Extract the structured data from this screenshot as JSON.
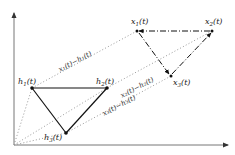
{
  "diagram": {
    "type": "formation-shape-diagram",
    "axes": {
      "origin": [
        14,
        145
      ],
      "y_end": [
        14,
        12
      ],
      "x_end": [
        229,
        145
      ],
      "color": "#555555"
    },
    "reference_shape": {
      "style": "solid",
      "color": "#111111",
      "nodes": [
        {
          "id": "h1",
          "label": "h",
          "sub": "1",
          "arg": "(t)",
          "x": 32,
          "y": 88,
          "label_x": 18,
          "label_y": 84
        },
        {
          "id": "h2",
          "label": "h",
          "sub": "2",
          "arg": "(t)",
          "x": 107,
          "y": 88,
          "label_x": 96,
          "label_y": 84
        },
        {
          "id": "h3",
          "label": "h",
          "sub": "3",
          "arg": "(t)",
          "x": 66,
          "y": 133,
          "label_x": 45,
          "label_y": 139
        }
      ]
    },
    "agent_shape": {
      "style": "dash-dot",
      "color": "#111111",
      "nodes": [
        {
          "id": "x1",
          "label": "x",
          "sub": "1",
          "arg": "(t)",
          "x": 137,
          "y": 31,
          "label_x": 131,
          "label_y": 22
        },
        {
          "id": "x2",
          "label": "x",
          "sub": "2",
          "arg": "(t)",
          "x": 212,
          "y": 31,
          "label_x": 206,
          "label_y": 22
        },
        {
          "id": "x3",
          "label": "x",
          "sub": "3",
          "arg": "(t)",
          "x": 171,
          "y": 76,
          "label_x": 174,
          "label_y": 82
        }
      ]
    },
    "offset_lines": {
      "style": "dotted",
      "color": "#888888",
      "items": [
        {
          "from": [
            14,
            145
          ],
          "via": [
            32,
            88
          ],
          "to": [
            137,
            31
          ],
          "label": "x₁(t)−h₁(t)",
          "label_x": 60,
          "label_y": 70,
          "angle": -28
        },
        {
          "from": [
            14,
            145
          ],
          "via": [
            107,
            88
          ],
          "to": [
            212,
            31
          ],
          "label": "x₂(t)−h₂(t)",
          "label_x": 120,
          "label_y": 99,
          "angle": -28
        },
        {
          "from": [
            14,
            145
          ],
          "via": [
            66,
            133
          ],
          "to": [
            171,
            76
          ],
          "label": "x₃(t)−h₃(t)",
          "label_x": 104,
          "label_y": 116,
          "angle": -28
        }
      ]
    },
    "text": {
      "x1_minus_h1": "x₁(t)−h₁(t)",
      "x2_minus_h2": "x₂(t)−h₂(t)",
      "x3_minus_h3": "x₃(t)−h₃(t)"
    }
  }
}
